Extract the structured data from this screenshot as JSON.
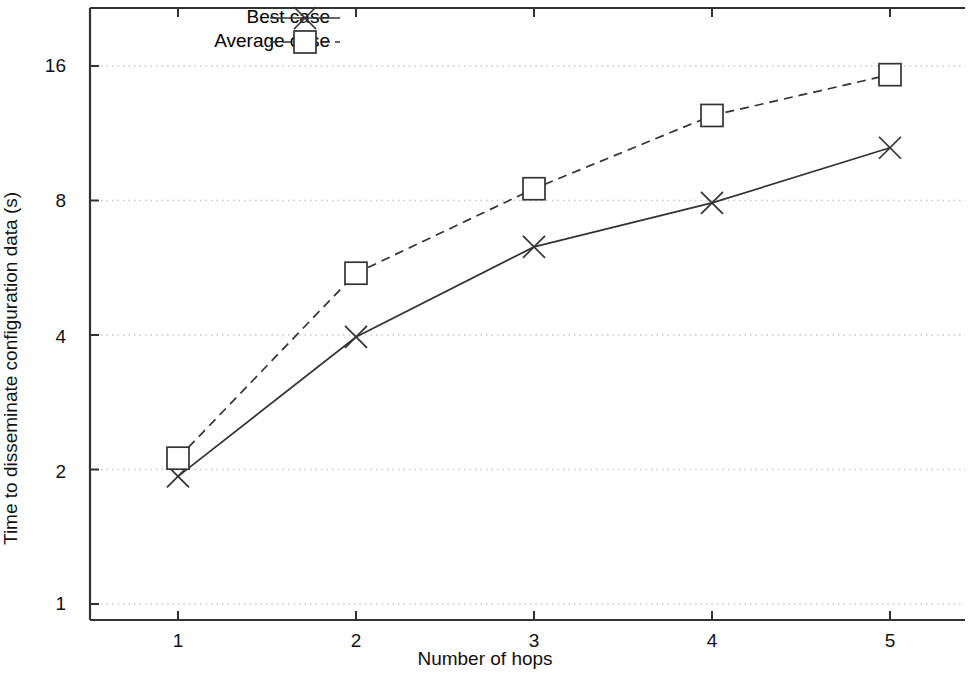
{
  "chart_data": {
    "type": "line",
    "title": "",
    "xlabel": "Number of hops",
    "ylabel": "Time to disseminate configuration data (s)",
    "x": [
      1,
      2,
      3,
      4,
      5
    ],
    "xticklabels": [
      "1",
      "2",
      "3",
      "4",
      "5"
    ],
    "yticklabels": [
      "1",
      "2",
      "4",
      "8",
      "16"
    ],
    "ytickvalues": [
      1,
      2,
      4,
      8,
      16
    ],
    "yscale": "log",
    "ylim": [
      1,
      18.8
    ],
    "xlim": [
      0.55,
      5.55
    ],
    "grid": "horizontal-dotted",
    "legend_position": "top-left-inside",
    "series": [
      {
        "name": "Best case",
        "marker": "x",
        "linestyle": "solid",
        "color": "#333333",
        "values": [
          1.93,
          3.96,
          6.3,
          7.9,
          10.5
        ]
      },
      {
        "name": "Average case",
        "marker": "square",
        "linestyle": "dashed",
        "color": "#333333",
        "values": [
          2.12,
          5.5,
          8.5,
          12.4,
          15.3
        ]
      }
    ]
  },
  "legend": {
    "entries": [
      {
        "label": "Best case"
      },
      {
        "label": "Average case"
      }
    ]
  },
  "axes": {
    "x_label": "Number of hops",
    "y_label": "Time to disseminate configuration data (s)",
    "x_ticks": [
      "1",
      "2",
      "3",
      "4",
      "5"
    ],
    "y_ticks": [
      "16",
      "8",
      "4",
      "2",
      "1"
    ]
  },
  "colors": {
    "line": "#333333",
    "axis": "#333333",
    "grid": "#c9c9c9",
    "text": "#111111",
    "background": "#ffffff"
  }
}
